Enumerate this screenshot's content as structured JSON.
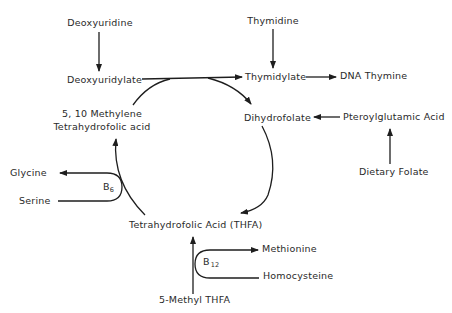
{
  "diagram": {
    "type": "metabolic-pathway",
    "nodes": {
      "deoxyuridine": "Deoxyuridine",
      "thymidine": "Thymidine",
      "deoxyuridylate": "Deoxyuridylate",
      "thymidylate": "Thymidylate",
      "dna_thymine": "DNA Thymine",
      "methylene_thfa_line1": "5, 10 Methylene",
      "methylene_thfa_line2": "Tetrahydrofolic acid",
      "dihydrofolate": "Dihydrofolate",
      "pteroylglutamic_acid": "Pteroylglutamic Acid",
      "dietary_folate": "Dietary Folate",
      "glycine": "Glycine",
      "serine": "Serine",
      "thfa": "Tetrahydrofolic Acid (THFA)",
      "methionine": "Methionine",
      "homocysteine": "Homocysteine",
      "methyl_thfa": "5-Methyl THFA"
    },
    "cofactors": {
      "b6": {
        "base": "B",
        "subscript": "6"
      },
      "b12": {
        "base": "B",
        "subscript": "12"
      }
    },
    "edges": [
      {
        "from": "Deoxyuridine",
        "to": "Deoxyuridylate"
      },
      {
        "from": "Thymidine",
        "to": "Thymidylate"
      },
      {
        "from": "Deoxyuridylate",
        "to": "Thymidylate"
      },
      {
        "from": "Thymidylate",
        "to": "DNA Thymine"
      },
      {
        "from": "5, 10 Methylene Tetrahydrofolic acid",
        "to": "Dihydrofolate"
      },
      {
        "from": "Pteroylglutamic Acid",
        "to": "Dihydrofolate"
      },
      {
        "from": "Dietary Folate",
        "to": "Pteroylglutamic Acid"
      },
      {
        "from": "Dihydrofolate",
        "to": "Tetrahydrofolic Acid (THFA)"
      },
      {
        "from": "Tetrahydrofolic Acid (THFA)",
        "to": "5, 10 Methylene Tetrahydrofolic acid"
      },
      {
        "from": "Serine",
        "to": "Glycine",
        "cofactor": "B6"
      },
      {
        "from": "5-Methyl THFA",
        "to": "Tetrahydrofolic Acid (THFA)"
      },
      {
        "from": "Homocysteine",
        "to": "Methionine",
        "cofactor": "B12"
      }
    ]
  }
}
